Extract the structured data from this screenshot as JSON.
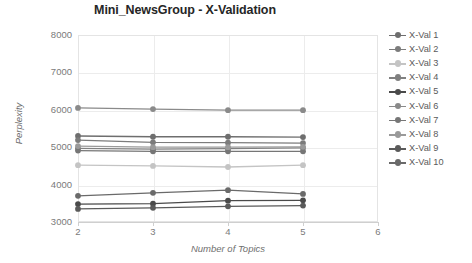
{
  "chart_data": {
    "type": "line",
    "title": "Mini_NewsGroup - X-Validation",
    "xlabel": "Number of Topics",
    "ylabel": "Perplexity",
    "x": [
      2,
      3,
      4,
      5
    ],
    "xlim": [
      2,
      6
    ],
    "ylim": [
      3000,
      8000
    ],
    "xticks": [
      "2",
      "3",
      "4",
      "5",
      "6"
    ],
    "yticks": [
      "3000",
      "4000",
      "5000",
      "6000",
      "7000",
      "8000"
    ],
    "grid": true,
    "legend_position": "right",
    "series": [
      {
        "name": "X-Val 1",
        "values": [
          5300,
          5280,
          5280,
          5270
        ],
        "color": "#6e6e6e"
      },
      {
        "name": "X-Val 2",
        "values": [
          5190,
          5130,
          5120,
          5110
        ],
        "color": "#7c7c7c"
      },
      {
        "name": "X-Val 3",
        "values": [
          4520,
          4500,
          4470,
          4520
        ],
        "color": "#c4c4c4"
      },
      {
        "name": "X-Val 4",
        "values": [
          4970,
          4950,
          4960,
          4980
        ],
        "color": "#808080"
      },
      {
        "name": "X-Val 5",
        "values": [
          3480,
          3490,
          3570,
          3580
        ],
        "color": "#4a4a4a"
      },
      {
        "name": "X-Val 6",
        "values": [
          6050,
          6020,
          5990,
          5990
        ],
        "color": "#8a8a8a"
      },
      {
        "name": "X-Val 7",
        "values": [
          4910,
          4890,
          4890,
          4890
        ],
        "color": "#767676"
      },
      {
        "name": "X-Val 8",
        "values": [
          5030,
          5000,
          5000,
          5010
        ],
        "color": "#9a9a9a"
      },
      {
        "name": "X-Val 9",
        "values": [
          3350,
          3380,
          3420,
          3440
        ],
        "color": "#5a5a5a"
      },
      {
        "name": "X-Val 10",
        "values": [
          3700,
          3780,
          3850,
          3750
        ],
        "color": "#6a6a6a"
      }
    ]
  }
}
